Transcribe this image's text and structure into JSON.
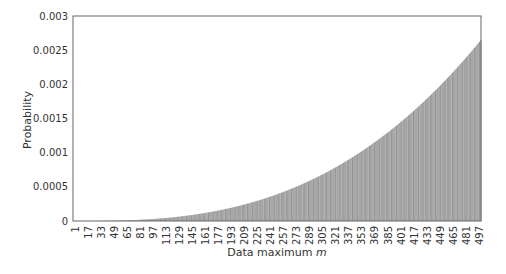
{
  "chart_data": {
    "type": "bar",
    "title": "",
    "xlabel": "Data maximum",
    "xlabel_var": "m",
    "ylabel": "Probability",
    "ylim": [
      0,
      0.003
    ],
    "xlim": [
      1,
      500
    ],
    "grid": false,
    "legend": null,
    "y_ticks": [
      "0",
      "0.0005",
      "0.001",
      "0.0015",
      "0.002",
      "0.0025",
      "0.003"
    ],
    "y_tick_values": [
      0,
      0.0005,
      0.001,
      0.0015,
      0.002,
      0.0025,
      0.003
    ],
    "x_ticks": [
      "1",
      "17",
      "33",
      "49",
      "65",
      "81",
      "97",
      "113",
      "129",
      "145",
      "161",
      "177",
      "193",
      "209",
      "225",
      "241",
      "257",
      "273",
      "289",
      "305",
      "321",
      "337",
      "353",
      "369",
      "385",
      "401",
      "417",
      "433",
      "449",
      "465",
      "481",
      "497"
    ],
    "x_tick_values": [
      1,
      17,
      33,
      49,
      65,
      81,
      97,
      113,
      129,
      145,
      161,
      177,
      193,
      209,
      225,
      241,
      257,
      273,
      289,
      305,
      321,
      337,
      353,
      369,
      385,
      401,
      417,
      433,
      449,
      465,
      481,
      497
    ],
    "series": [
      {
        "name": "P(m)",
        "description": "Probability of data maximum m, increasing roughly as a power of m",
        "sample_points": {
          "m": [
            1,
            50,
            100,
            130,
            200,
            253,
            300,
            350,
            388,
            450,
            500
          ],
          "values": [
            0.0,
            5e-06,
            3.2e-05,
            7e-05,
            0.00022,
            0.0004,
            0.00063,
            0.00096,
            0.00129,
            0.00198,
            0.00265
          ]
        },
        "model": {
          "form": "a*(m/500)^k",
          "a": 0.00265,
          "k": 2.75
        }
      }
    ],
    "bar_color": "#9a9a9a"
  }
}
